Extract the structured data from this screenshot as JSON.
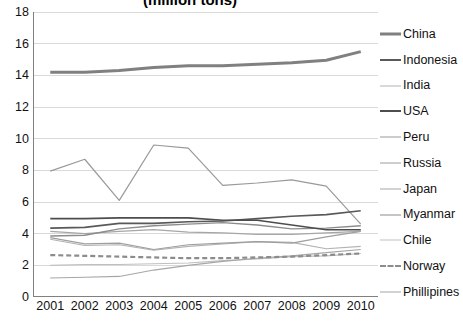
{
  "chart_data": {
    "type": "line",
    "title": "(million tons)",
    "xlabel": "",
    "ylabel": "",
    "x": [
      2001,
      2002,
      2003,
      2004,
      2005,
      2006,
      2007,
      2008,
      2009,
      2010
    ],
    "categories": [
      "2001",
      "2002",
      "2003",
      "2004",
      "2005",
      "2006",
      "2007",
      "2008",
      "2009",
      "2010"
    ],
    "ylim": [
      0,
      18
    ],
    "ytick_step": 2,
    "yticks": [
      0,
      2,
      4,
      6,
      8,
      10,
      12,
      14,
      16,
      18
    ],
    "ytick_labels": [
      "0",
      "2",
      "4",
      "6",
      "8",
      "10",
      "12",
      "14",
      "16",
      "18"
    ],
    "grid": "horizontal",
    "legend_position": "right",
    "series": [
      {
        "name": "China",
        "values": [
          14.2,
          14.2,
          14.3,
          14.5,
          14.6,
          14.6,
          14.7,
          14.8,
          14.95,
          15.5
        ],
        "color": "#808080",
        "width": 3.0,
        "dash": "solid"
      },
      {
        "name": "Indonesia",
        "values": [
          4.35,
          4.4,
          4.65,
          4.65,
          4.75,
          4.8,
          4.95,
          5.1,
          5.2,
          5.45
        ],
        "color": "#595959",
        "width": 1.6,
        "dash": "solid"
      },
      {
        "name": "India",
        "values": [
          3.65,
          3.25,
          3.3,
          2.95,
          3.2,
          3.35,
          3.5,
          3.45,
          3.05,
          3.2
        ],
        "color": "#b3b3b3",
        "width": 1.1,
        "dash": "solid"
      },
      {
        "name": "USA",
        "values": [
          4.95,
          4.95,
          5.0,
          5.0,
          5.0,
          4.85,
          4.85,
          4.55,
          4.25,
          4.25
        ],
        "color": "#4d4d4d",
        "width": 1.6,
        "dash": "solid"
      },
      {
        "name": "Peru",
        "values": [
          7.95,
          8.7,
          6.1,
          9.6,
          9.4,
          7.05,
          7.2,
          7.4,
          7.0,
          4.6
        ],
        "color": "#999999",
        "width": 1.2,
        "dash": "solid"
      },
      {
        "name": "Russia",
        "values": [
          3.75,
          3.35,
          3.4,
          3.0,
          3.3,
          3.4,
          3.5,
          3.4,
          3.8,
          4.15
        ],
        "color": "#9e9e9e",
        "width": 1.2,
        "dash": "solid"
      },
      {
        "name": "Japan",
        "values": [
          4.15,
          4.0,
          4.15,
          4.25,
          4.1,
          4.05,
          3.95,
          3.95,
          4.05,
          4.15
        ],
        "color": "#a6a6a6",
        "width": 1.2,
        "dash": "solid"
      },
      {
        "name": "Myanmar",
        "values": [
          3.85,
          3.9,
          4.3,
          4.5,
          4.6,
          4.7,
          4.55,
          4.3,
          4.35,
          4.5
        ],
        "color": "#8c8c8c",
        "width": 1.4,
        "dash": "solid"
      },
      {
        "name": "Chile",
        "values": [
          2.0,
          2.05,
          2.05,
          2.1,
          2.15,
          2.3,
          2.4,
          2.55,
          2.6,
          2.75
        ],
        "color": "#bfbfbf",
        "width": 1.1,
        "dash": "solid"
      },
      {
        "name": "Norway",
        "values": [
          2.65,
          2.6,
          2.55,
          2.5,
          2.45,
          2.45,
          2.5,
          2.55,
          2.65,
          2.75
        ],
        "color": "#8c8c8c",
        "width": 2.2,
        "dash": "dashed"
      },
      {
        "name": "Phillipines",
        "values": [
          1.2,
          1.25,
          1.3,
          1.7,
          2.0,
          2.25,
          2.45,
          2.6,
          2.8,
          3.0
        ],
        "color": "#a6a6a6",
        "width": 1.1,
        "dash": "solid"
      }
    ]
  },
  "axis": {
    "axis_line_color": "#808080",
    "gridline_color": "#d9d9d9"
  }
}
